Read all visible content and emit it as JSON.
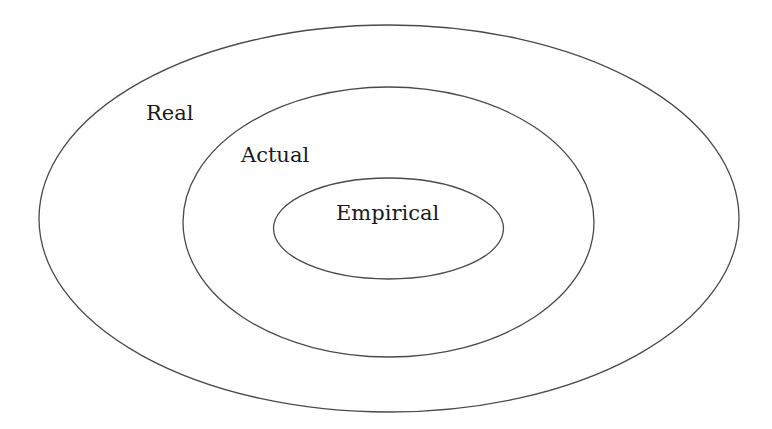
{
  "diagram": {
    "type": "nested-ellipses",
    "stroke_color": "#4a4a4a",
    "text_color": "#1a1a1a",
    "background": "#ffffff",
    "layers": [
      {
        "id": "real",
        "label": "Real",
        "cx": 389,
        "cy": 218.5,
        "rx": 350,
        "ry": 193.5,
        "label_x": 146,
        "label_y": 120
      },
      {
        "id": "actual",
        "label": "Actual",
        "cx": 388.5,
        "cy": 222,
        "rx": 205.5,
        "ry": 135,
        "label_x": 241,
        "label_y": 162
      },
      {
        "id": "empirical",
        "label": "Empirical",
        "cx": 388.5,
        "cy": 228.5,
        "rx": 115,
        "ry": 50.5,
        "label_x": 336,
        "label_y": 220
      }
    ]
  }
}
